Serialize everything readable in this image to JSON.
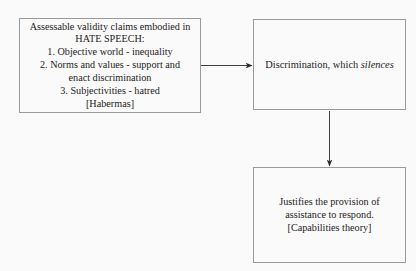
{
  "diagram": {
    "type": "flowchart",
    "background_color": "#fbfafa",
    "border_color": "#9a9a9a",
    "text_color": "#1b1b1b",
    "nodes": [
      {
        "id": "hate-speech",
        "lines": [
          "Assessable validity claims embodied in",
          "HATE SPEECH:",
          "1. Objective world - inequality",
          "2. Norms and values - support and",
          "enact discrimination",
          "3. Subjectivities - hatred",
          "[Habermas]"
        ]
      },
      {
        "id": "discrimination",
        "lead": "Discrimination, which ",
        "emphasis": "silences"
      },
      {
        "id": "justifies",
        "lines": [
          "Justifies the provision of",
          "assistance to respond.",
          "[Capabilities theory]"
        ]
      }
    ],
    "edges": [
      {
        "id": "hate-speech-to-discrimination",
        "direction": "right"
      },
      {
        "id": "discrimination-to-justifies",
        "direction": "down"
      }
    ]
  }
}
